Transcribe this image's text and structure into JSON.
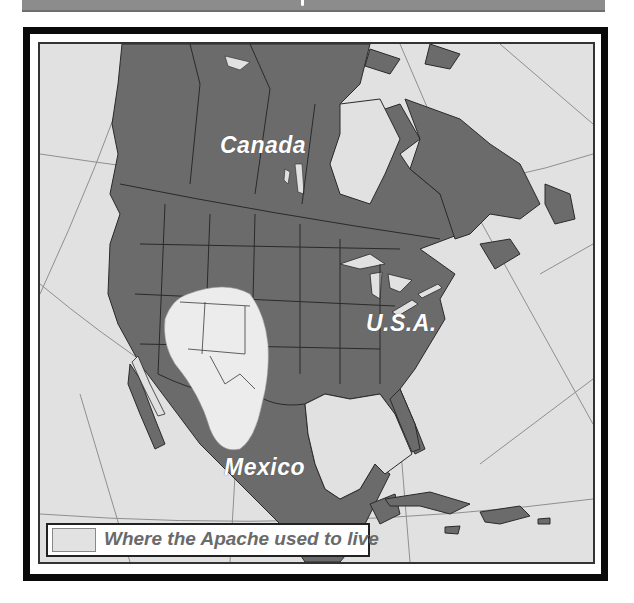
{
  "header": {
    "title": ""
  },
  "map": {
    "colors": {
      "land": "#6b6b6b",
      "ocean": "#e1e1e1",
      "apache_region": "#ececec",
      "borders": "#2a2a2a",
      "graticule": "#8a8a8a",
      "frame": "#0a0a0a"
    },
    "labels": {
      "canada": "Canada",
      "usa": "U.S.A.",
      "mexico": "Mexico"
    }
  },
  "legend": {
    "swatch_color": "#e2e2e2",
    "text": "Where the Apache used to live"
  }
}
